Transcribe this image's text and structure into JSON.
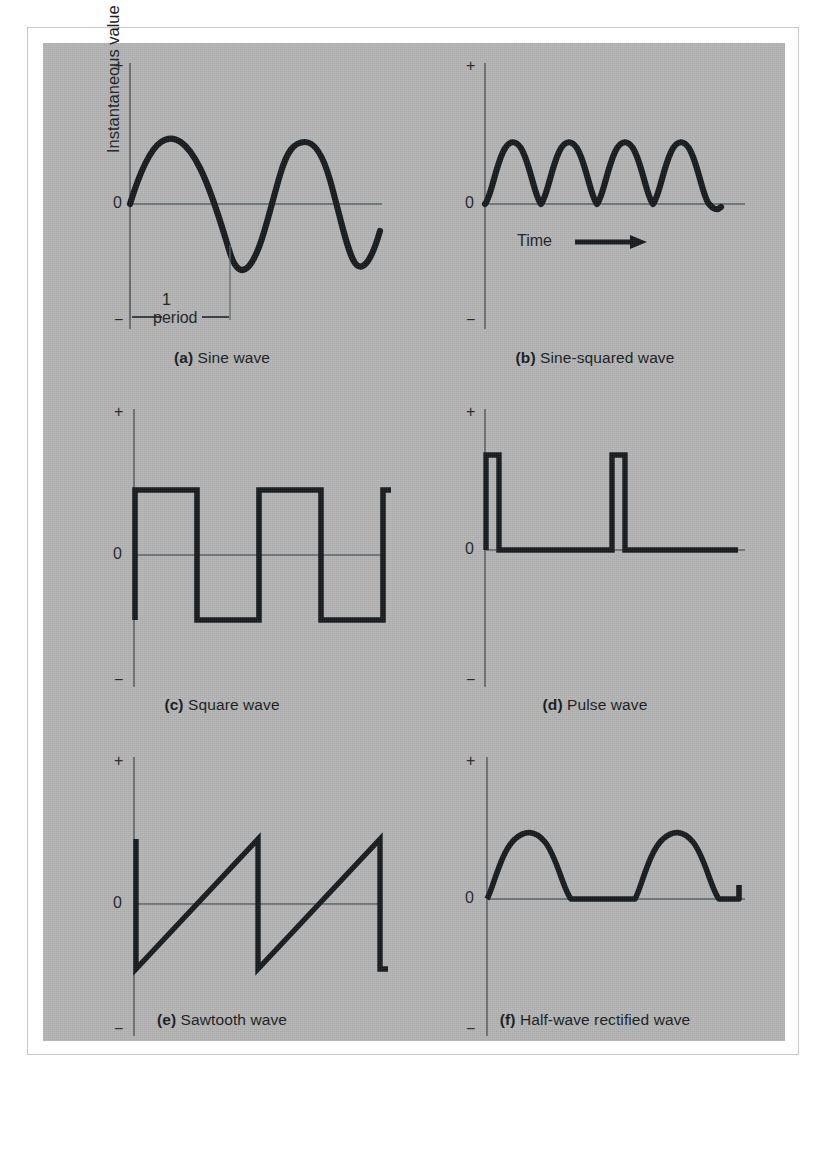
{
  "figure": {
    "background_color": "#ffffff",
    "panel_color": "#b4b4b4",
    "ink_color": "#15191c",
    "axis_color": "#555a5e",
    "y_axis_label": "Instantaneous value",
    "x_axis_label": "Time",
    "period_number": "1",
    "period_word": "period",
    "plus_sign": "+",
    "minus_sign": "−",
    "zero_label": "0"
  },
  "panels": [
    {
      "key": "a",
      "tag": "(a)",
      "caption": "Sine wave",
      "caption_full": "(a) Sine wave",
      "has_y_axis_label": true,
      "has_plus": true,
      "has_minus": true,
      "has_zero": true,
      "has_period_annotation": true,
      "has_time_label": false
    },
    {
      "key": "b",
      "tag": "(b)",
      "caption": "Sine-squared wave",
      "caption_full": "(b) Sine-squared wave",
      "has_y_axis_label": false,
      "has_plus": true,
      "has_minus": true,
      "has_zero": true,
      "has_period_annotation": false,
      "has_time_label": true
    },
    {
      "key": "c",
      "tag": "(c)",
      "caption": "Square wave",
      "caption_full": "(c) Square wave",
      "has_y_axis_label": false,
      "has_plus": true,
      "has_minus": true,
      "has_zero": true,
      "has_period_annotation": false,
      "has_time_label": false
    },
    {
      "key": "d",
      "tag": "(d)",
      "caption": "Pulse wave",
      "caption_full": "(d) Pulse wave",
      "has_y_axis_label": false,
      "has_plus": true,
      "has_minus": true,
      "has_zero": true,
      "has_period_annotation": false,
      "has_time_label": false
    },
    {
      "key": "e",
      "tag": "(e)",
      "caption": "Sawtooth wave",
      "caption_full": "(e) Sawtooth wave",
      "has_y_axis_label": false,
      "has_plus": true,
      "has_minus": true,
      "has_zero": true,
      "has_period_annotation": false,
      "has_time_label": false
    },
    {
      "key": "f",
      "tag": "(f)",
      "caption": "Half-wave rectified wave",
      "caption_full": "(f) Half-wave rectified wave",
      "has_y_axis_label": false,
      "has_plus": true,
      "has_minus": true,
      "has_zero": true,
      "has_period_annotation": false,
      "has_time_label": false
    }
  ],
  "chart_data": [
    {
      "id": "a",
      "type": "line",
      "title": "(a) Sine wave",
      "xlabel": "Time",
      "ylabel": "Instantaneous value",
      "ytick_labels": [
        "+",
        "0",
        "−"
      ],
      "ylim": [
        -1.45,
        1.45
      ],
      "xlim": [
        0,
        2.55
      ],
      "grid": false,
      "legend": "none",
      "function": "sin(2*pi*x)",
      "amplitude": 1.0,
      "cycles_shown": 2.55,
      "annotation": {
        "text": "1 period",
        "from_x": 0.0,
        "to_x": 1.0,
        "y": -1.3
      },
      "x": [
        0,
        0.0625,
        0.125,
        0.1875,
        0.25,
        0.3125,
        0.375,
        0.4375,
        0.5,
        0.5625,
        0.625,
        0.6875,
        0.75,
        0.8125,
        0.875,
        0.9375,
        1,
        1.125,
        1.25,
        1.375,
        1.5,
        1.625,
        1.75,
        1.875,
        2,
        2.125,
        2.25,
        2.375,
        2.5
      ],
      "y": [
        0,
        0.383,
        0.707,
        0.924,
        1,
        0.924,
        0.707,
        0.383,
        0,
        -0.383,
        -0.707,
        -0.924,
        -1,
        -0.924,
        -0.707,
        -0.383,
        0,
        0.707,
        1,
        0.707,
        0,
        -0.707,
        -1,
        -0.707,
        0,
        0.707,
        1,
        0.707,
        0
      ]
    },
    {
      "id": "b",
      "type": "line",
      "title": "(b) Sine-squared wave",
      "xlabel": "Time",
      "ylabel": "",
      "ytick_labels": [
        "+",
        "0",
        "−"
      ],
      "ylim": [
        -1.45,
        1.45
      ],
      "xlim": [
        0,
        4.1
      ],
      "grid": false,
      "legend": "none",
      "function": "sin^2(pi*x)",
      "amplitude": 1.0,
      "cycles_shown": 4.1,
      "x": [
        0,
        0.25,
        0.5,
        0.75,
        1,
        1.25,
        1.5,
        1.75,
        2,
        2.25,
        2.5,
        2.75,
        3,
        3.25,
        3.5,
        3.75,
        4
      ],
      "y": [
        0,
        0.5,
        1,
        0.5,
        0,
        0.5,
        1,
        0.5,
        0,
        0.5,
        1,
        0.5,
        0,
        0.5,
        1,
        0.5,
        0
      ]
    },
    {
      "id": "c",
      "type": "line",
      "title": "(c) Square wave",
      "xlabel": "Time",
      "ylabel": "",
      "ytick_labels": [
        "+",
        "0",
        "−"
      ],
      "ylim": [
        -1.45,
        1.45
      ],
      "xlim": [
        0,
        2.55
      ],
      "grid": false,
      "legend": "none",
      "function": "square(2*pi*x)",
      "amplitude": 1.0,
      "duty_cycle_percent": 50,
      "cycles_shown": 2.55,
      "x": [
        0,
        0,
        0.5,
        0.5,
        1,
        1,
        1.5,
        1.5,
        2,
        2,
        2.5
      ],
      "y": [
        -1,
        1,
        1,
        -1,
        -1,
        1,
        1,
        -1,
        -1,
        1,
        1
      ]
    },
    {
      "id": "d",
      "type": "line",
      "title": "(d) Pulse wave",
      "xlabel": "Time",
      "ylabel": "",
      "ytick_labels": [
        "+",
        "0",
        "−"
      ],
      "ylim": [
        -1.45,
        1.45
      ],
      "xlim": [
        0,
        2.6
      ],
      "grid": false,
      "legend": "none",
      "function": "narrow pulse train",
      "amplitude": 1.45,
      "duty_cycle_percent": 10,
      "pulses_shown": 2,
      "x": [
        0,
        0,
        0.1,
        0.1,
        1,
        1,
        1.1,
        1.1,
        2.6
      ],
      "y": [
        0,
        1.45,
        1.45,
        0,
        0,
        1.45,
        1.45,
        0,
        0
      ]
    },
    {
      "id": "e",
      "type": "line",
      "title": "(e) Sawtooth wave",
      "xlabel": "Time",
      "ylabel": "",
      "ytick_labels": [
        "+",
        "0",
        "−"
      ],
      "ylim": [
        -1.45,
        1.45
      ],
      "xlim": [
        0,
        2.1
      ],
      "grid": false,
      "legend": "none",
      "function": "sawtooth ramp",
      "amplitude": 1.0,
      "cycles_shown": 2.1,
      "x": [
        0,
        0,
        1,
        1,
        2,
        2,
        2.08
      ],
      "y": [
        1,
        -1,
        1,
        -1,
        1,
        -1,
        -1
      ]
    },
    {
      "id": "f",
      "type": "line",
      "title": "(f) Half-wave rectified wave",
      "xlabel": "Time",
      "ylabel": "",
      "ytick_labels": [
        "+",
        "0",
        "−"
      ],
      "ylim": [
        -1.45,
        1.45
      ],
      "xlim": [
        0,
        2.6
      ],
      "grid": false,
      "legend": "none",
      "function": "max(sin(2*pi*x), 0)",
      "amplitude": 1.0,
      "cycles_shown": 2.6,
      "x": [
        0,
        0.125,
        0.25,
        0.375,
        0.5,
        0.75,
        1,
        1.125,
        1.25,
        1.375,
        1.5,
        1.75,
        2,
        2.25,
        2.5
      ],
      "y": [
        0,
        0.707,
        1,
        0.707,
        0,
        0,
        0,
        0.707,
        1,
        0.707,
        0,
        0,
        0,
        0,
        0
      ]
    }
  ]
}
